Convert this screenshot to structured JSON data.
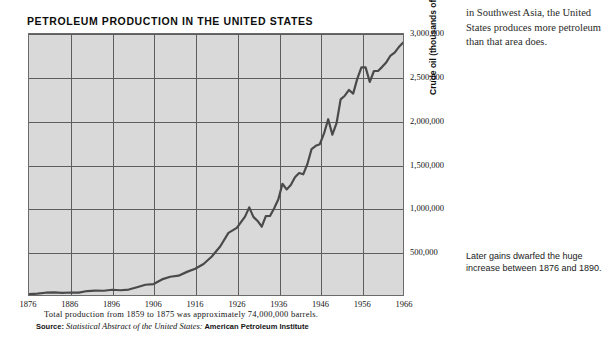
{
  "chart": {
    "title": "PETROLEUM PRODUCTION IN THE UNITED STATES",
    "yaxis_title": "Crude oil (thousands of barrels)",
    "note_total": "Total production from 1859 to 1875 was approximately 74,000,000 barrels.",
    "source_label": "Source:",
    "source_italic": "Statistical Abstract of the United States:",
    "source_agency": "American Petroleum Institute"
  },
  "side_text": {
    "top": "in Southwest Asia, the United States produces more petroleum than that area does.",
    "bottom": "Later gains dwarfed the huge increase between 1876 and 1890."
  },
  "colors": {
    "plot_background": "#d9d9d9",
    "grid": "#5d5d5d",
    "border": "#6b6b6b",
    "data_line": "#4a4a4a",
    "page_background": "#ffffff"
  },
  "chart_data": {
    "type": "line",
    "title": "PETROLEUM PRODUCTION IN THE UNITED STATES",
    "xlabel": "",
    "ylabel": "Crude oil (thousands of barrels)",
    "xlim": [
      1876,
      1966
    ],
    "ylim": [
      0,
      3000000
    ],
    "xticks": [
      1876,
      1886,
      1896,
      1906,
      1916,
      1926,
      1936,
      1946,
      1956,
      1966
    ],
    "yticks": [
      500000,
      1000000,
      1500000,
      2000000,
      2500000,
      3000000
    ],
    "ytick_labels": [
      "500,000",
      "1,000,000",
      "1,500,000",
      "2,000,000",
      "2,500,000",
      "3,000,000"
    ],
    "xtick_labels": [
      "1876",
      "1886",
      "1896",
      "1906",
      "1916",
      "1926",
      "1936",
      "1946",
      "1956",
      "1966"
    ],
    "grid": true,
    "legend": false,
    "series": [
      {
        "name": "Crude oil production",
        "x": [
          1876,
          1878,
          1880,
          1882,
          1884,
          1886,
          1888,
          1890,
          1892,
          1894,
          1896,
          1898,
          1900,
          1902,
          1904,
          1906,
          1908,
          1910,
          1912,
          1914,
          1916,
          1918,
          1920,
          1922,
          1924,
          1926,
          1928,
          1929,
          1930,
          1931,
          1932,
          1933,
          1934,
          1935,
          1936,
          1937,
          1938,
          1939,
          1940,
          1941,
          1942,
          1943,
          1944,
          1945,
          1946,
          1947,
          1948,
          1949,
          1950,
          1951,
          1952,
          1953,
          1954,
          1955,
          1956,
          1957,
          1958,
          1959,
          1960,
          1961,
          1962,
          1963,
          1964,
          1965,
          1966
        ],
        "y": [
          9000,
          15000,
          26000,
          30000,
          24000,
          28000,
          27000,
          46000,
          51000,
          49000,
          61000,
          55000,
          63000,
          89000,
          117000,
          126000,
          179000,
          210000,
          222000,
          266000,
          301000,
          356000,
          443000,
          558000,
          714000,
          771000,
          901000,
          1007000,
          898000,
          851000,
          785000,
          906000,
          908000,
          997000,
          1100000,
          1279000,
          1214000,
          1265000,
          1353000,
          1402000,
          1387000,
          1506000,
          1678000,
          1714000,
          1734000,
          1857000,
          2020000,
          1842000,
          1974000,
          2248000,
          2290000,
          2357000,
          2315000,
          2484000,
          2617000,
          2617000,
          2449000,
          2575000,
          2575000,
          2622000,
          2676000,
          2753000,
          2787000,
          2849000,
          2900000
        ]
      }
    ]
  }
}
